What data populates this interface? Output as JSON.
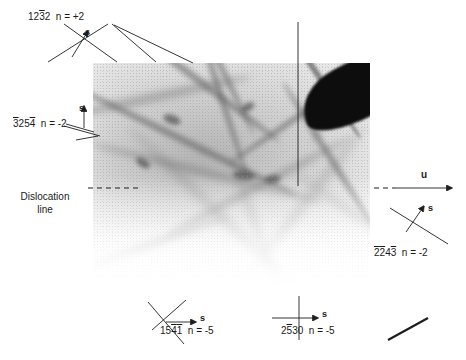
{
  "figure": {
    "type": "tem-micrograph-annotated",
    "width": 466,
    "height": 360,
    "background_color": "#ffffff",
    "ink_color": "#1e1e1e"
  },
  "micrograph": {
    "name": "dislocation-network-micrograph",
    "left": 93,
    "top": 63,
    "width": 277,
    "height": 222,
    "description": "Transmission electron micrograph showing a network of crossing dislocation lines on a grey speckled background, with a dark wedge-shaped feature in the upper right and the contrast fading to white toward the bottom.",
    "dark_feature": "dark-wedge"
  },
  "annotations": {
    "dislocation_line": {
      "name": "dislocation-line-callout",
      "label_line_1": "Dislocation",
      "label_line_2": "line",
      "marker": "horizontal-dashed-line"
    },
    "u_vector": {
      "name": "u-vector",
      "label": "u",
      "marker": "right-arrow"
    },
    "s_vectors": [
      {
        "id": "s-top-left",
        "label": "s"
      },
      {
        "id": "s-mid-left",
        "label": "s"
      },
      {
        "id": "s-right",
        "label": "s"
      },
      {
        "id": "s-bottom-left",
        "label": "s"
      },
      {
        "id": "s-bottom-right",
        "label": "s"
      }
    ],
    "reflections": [
      {
        "id": "reflection-top-left",
        "indices": [
          {
            "d": "1",
            "bar": false
          },
          {
            "d": "2",
            "bar": false
          },
          {
            "d": "3",
            "bar": true
          },
          {
            "d": "2",
            "bar": false
          }
        ],
        "plain": "1232",
        "n_text": "n = +2",
        "n_value": 2
      },
      {
        "id": "reflection-mid-left",
        "indices": [
          {
            "d": "3",
            "bar": true
          },
          {
            "d": "2",
            "bar": false
          },
          {
            "d": "5",
            "bar": false
          },
          {
            "d": "4",
            "bar": true
          }
        ],
        "plain": "3254",
        "n_text": "n = -2",
        "n_value": -2
      },
      {
        "id": "reflection-right",
        "indices": [
          {
            "d": "2",
            "bar": true
          },
          {
            "d": "2",
            "bar": true
          },
          {
            "d": "4",
            "bar": false
          },
          {
            "d": "3",
            "bar": true
          }
        ],
        "plain": "2243",
        "n_text": "n = -2",
        "n_value": -2
      },
      {
        "id": "reflection-bottom-left",
        "indices": [
          {
            "d": "1",
            "bar": false
          },
          {
            "d": "5",
            "bar": false
          },
          {
            "d": "4",
            "bar": true
          },
          {
            "d": "1",
            "bar": true
          }
        ],
        "plain": "1541",
        "n_text": "n = -5",
        "n_value": -5
      },
      {
        "id": "reflection-bottom-right",
        "indices": [
          {
            "d": "2",
            "bar": false
          },
          {
            "d": "5",
            "bar": true
          },
          {
            "d": "3",
            "bar": false
          },
          {
            "d": "0",
            "bar": false
          }
        ],
        "plain": "2530",
        "n_text": "n = -5",
        "n_value": -5
      }
    ]
  }
}
